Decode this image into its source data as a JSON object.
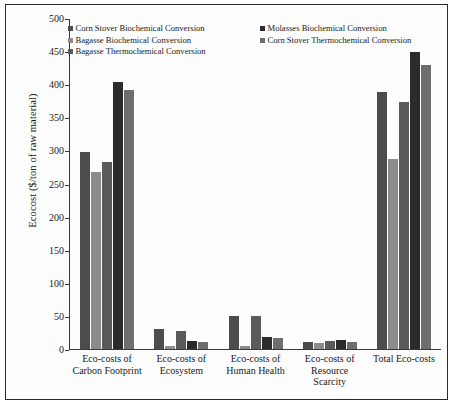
{
  "chart_data": {
    "type": "bar",
    "title": "",
    "xlabel": "",
    "ylabel": "Ecocost ($/ton of raw material)",
    "ylim": [
      0,
      500
    ],
    "yticks": [
      0,
      50,
      100,
      150,
      200,
      250,
      300,
      350,
      400,
      450,
      500
    ],
    "grid": false,
    "legend_position": "top-inside",
    "categories": [
      "Eco-costs of Carbon Footprint",
      "Eco-costs of Ecosystem",
      "Eco-costs of Human Health",
      "Eco-costs of Resource Scarcity",
      "Total Eco-costs"
    ],
    "category_lines": [
      [
        "Eco-costs of",
        "Carbon Footprint"
      ],
      [
        "Eco-costs of",
        "Ecosystem"
      ],
      [
        "Eco-costs of",
        "Human Health"
      ],
      [
        "Eco-costs of",
        "Resource",
        "Scarcity"
      ],
      [
        "Total Eco-costs"
      ]
    ],
    "series": [
      {
        "name": "Corn Stover Biochemical Conversion",
        "color": "#4d4d4d",
        "values": [
          298,
          30,
          50,
          10,
          390
        ]
      },
      {
        "name": "Bagasse Biochemical Conversion",
        "color": "#8c8c8c",
        "values": [
          268,
          5,
          4,
          9,
          288
        ]
      },
      {
        "name": "Bagasse Thermochemical Conversion",
        "color": "#5a5a5a",
        "values": [
          283,
          28,
          50,
          12,
          375
        ]
      },
      {
        "name": "Molasses Biochemical Conversion",
        "color": "#2b2b2b",
        "values": [
          405,
          12,
          18,
          13,
          450
        ]
      },
      {
        "name": "Corn Stover Thermochemical Conversion",
        "color": "#6e6e6e",
        "values": [
          393,
          10,
          17,
          10,
          430
        ]
      }
    ]
  },
  "legend": {
    "column_left": [
      "Corn Stover Biochemical Conversion",
      "Bagasse Biochemical Conversion",
      "Bagasse Thermochemical Conversion"
    ],
    "column_right": [
      "Molasses Biochemical Conversion",
      "Corn Stover Thermochemical Conversion"
    ]
  }
}
